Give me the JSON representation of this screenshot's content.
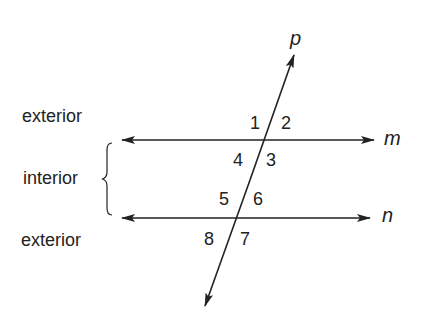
{
  "diagram": {
    "type": "parallel lines cut by a transversal",
    "region_labels": {
      "top": "exterior",
      "middle": "interior",
      "bottom": "exterior"
    },
    "lines": {
      "transversal": "p",
      "upper": "m",
      "lower": "n"
    },
    "angles": [
      "1",
      "2",
      "3",
      "4",
      "5",
      "6",
      "7",
      "8"
    ],
    "colors": {
      "ink": "#222222",
      "background": "#ffffff"
    }
  }
}
